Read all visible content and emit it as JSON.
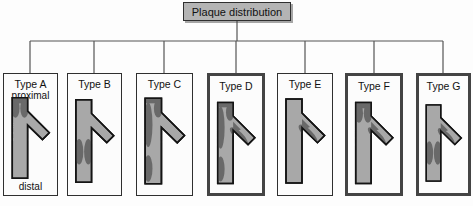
{
  "title": "Plaque distribution",
  "boxes": [
    {
      "label": "Type A",
      "sublabel_top": "proximal",
      "sublabel_bottom": "distal",
      "emphasis": false,
      "plaques": [
        "proximal-main"
      ]
    },
    {
      "label": "Type B",
      "emphasis": false,
      "plaques": [
        "distal-main"
      ]
    },
    {
      "label": "Type C",
      "emphasis": false,
      "plaques": [
        "main-left-wall"
      ]
    },
    {
      "label": "Type D",
      "emphasis": true,
      "plaques": [
        "main-left-wall",
        "branch"
      ]
    },
    {
      "label": "Type E",
      "emphasis": false,
      "plaques": [
        "branch"
      ]
    },
    {
      "label": "Type F",
      "emphasis": true,
      "plaques": [
        "proximal-main",
        "branch"
      ]
    },
    {
      "label": "Type G",
      "emphasis": true,
      "plaques": [
        "branch",
        "distal-main"
      ]
    }
  ],
  "colors": {
    "vessel": "#a8a8a8",
    "plaque": "#696969",
    "outline": "#141414",
    "title_fill": "#b4b4b4",
    "connector": "#555555",
    "border": "#2f2f2f",
    "box_fill": "#fcfcfc",
    "page_bg": "#fdfdfd"
  }
}
